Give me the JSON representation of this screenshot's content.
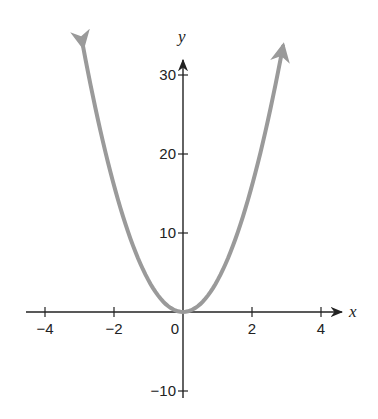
{
  "chart_data": {
    "type": "line",
    "title": "",
    "function": "y = 4x^2",
    "xlabel": "x",
    "ylabel": "y",
    "xlim": [
      -4.2,
      4.6
    ],
    "ylim": [
      -11,
      34
    ],
    "x_ticks": [
      -4,
      -2,
      0,
      2,
      4
    ],
    "x_tick_labels": [
      "−4",
      "−2",
      "0",
      "2",
      "4"
    ],
    "y_ticks": [
      -10,
      10,
      20,
      30
    ],
    "y_tick_labels": [
      "−10",
      "10",
      "20",
      "30"
    ],
    "grid": false,
    "legend": null,
    "series": [
      {
        "name": "parabola",
        "color": "#9a9a9a",
        "arrows_at_ends": true,
        "x": [
          -2.9,
          -2.5,
          -2,
          -1.5,
          -1,
          -0.5,
          0,
          0.5,
          1,
          1.5,
          2,
          2.5,
          2.9
        ],
        "y": [
          33.6,
          25,
          16,
          9,
          4,
          1,
          0,
          1,
          4,
          9,
          16,
          25,
          33.6
        ]
      }
    ],
    "colors": {
      "axis": "#222222",
      "curve": "#9a9a9a"
    }
  }
}
